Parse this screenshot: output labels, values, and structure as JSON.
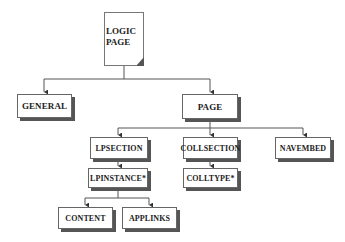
{
  "diagram": {
    "root": {
      "label_line1": "LOGIC",
      "label_line2": "PAGE"
    },
    "level1": {
      "general": "GENERAL",
      "page": "PAGE"
    },
    "level2": {
      "lpsection": "LPSECTION",
      "collsection": "COLLSECTION",
      "navembed": "NAVEMBED"
    },
    "level3": {
      "lpinstance": "LPINSTANCE*",
      "colltype": "COLLTYPE*"
    },
    "level4": {
      "content": "CONTENT",
      "applinks": "APPLINKS"
    },
    "colors": {
      "line": "#555555",
      "shadow": "#555555",
      "text": "#222222"
    }
  }
}
